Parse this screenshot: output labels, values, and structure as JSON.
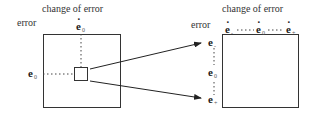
{
  "left_panel": {
    "x_label": "change of error",
    "y_label": "error",
    "top_var": {
      "symbol": "e",
      "dot": true,
      "subscript": "0"
    },
    "left_var": {
      "symbol": "e",
      "dot": false,
      "subscript": "0"
    }
  },
  "right_panel": {
    "x_label": "change of error",
    "y_label": "error",
    "top_vars": [
      {
        "symbol": "e",
        "dot": true,
        "subscript": "-"
      },
      {
        "symbol": "e",
        "dot": true,
        "subscript": "0"
      },
      {
        "symbol": "e",
        "dot": true,
        "subscript": "+"
      }
    ],
    "left_vars": [
      {
        "symbol": "e",
        "dot": false,
        "subscript": "-"
      },
      {
        "symbol": "e",
        "dot": false,
        "subscript": "0"
      },
      {
        "symbol": "e",
        "dot": false,
        "subscript": "+"
      }
    ]
  }
}
